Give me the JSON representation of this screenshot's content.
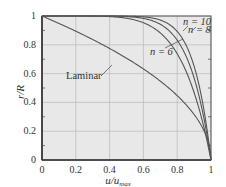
{
  "chart_data": {
    "type": "line",
    "title": "",
    "xlabel": "u/u_max",
    "ylabel": "r/R",
    "xlim": [
      0,
      1
    ],
    "ylim": [
      0,
      1
    ],
    "grid": true,
    "legend": "inline annotations",
    "xticks": [
      "0",
      "0.2",
      "0.4",
      "0.6",
      "0.8",
      "1"
    ],
    "yticks": [
      "0",
      "0.2",
      "0.4",
      "0.6",
      "0.8",
      "1"
    ],
    "series": [
      {
        "name": "Laminar",
        "formula": "r/R = sqrt(1 - u/u_max)",
        "x": [
          0,
          0.2,
          0.4,
          0.6,
          0.8,
          0.9,
          0.96,
          1.0
        ],
        "y": [
          1.0,
          0.894,
          0.775,
          0.632,
          0.447,
          0.316,
          0.2,
          0.0
        ]
      },
      {
        "name": "n = 6",
        "formula": "r/R = 1 - (u/u_max)^6",
        "x": [
          0,
          0.4,
          0.6,
          0.7,
          0.8,
          0.9,
          0.95,
          1.0
        ],
        "y": [
          1.0,
          0.996,
          0.953,
          0.882,
          0.738,
          0.469,
          0.265,
          0.0
        ]
      },
      {
        "name": "n = 8",
        "formula": "r/R = 1 - (u/u_max)^8",
        "x": [
          0,
          0.5,
          0.7,
          0.8,
          0.9,
          0.95,
          1.0
        ],
        "y": [
          1.0,
          0.996,
          0.942,
          0.832,
          0.57,
          0.337,
          0.0
        ]
      },
      {
        "name": "n = 10",
        "formula": "r/R = 1 - (u/u_max)^10",
        "x": [
          0,
          0.5,
          0.7,
          0.8,
          0.9,
          0.95,
          1.0
        ],
        "y": [
          1.0,
          0.999,
          0.972,
          0.893,
          0.651,
          0.401,
          0.0
        ]
      }
    ],
    "annotations": [
      "Laminar",
      "n = 6",
      "n = 8",
      "n = 10"
    ]
  },
  "labels": {
    "x_axis": "u/u",
    "x_axis_sub": "max",
    "y_axis": "r/R",
    "laminar": "Laminar",
    "n6": "n = 6",
    "n8": "n = 8",
    "n10": "n = 10"
  },
  "colors": {
    "plot_bg": "#e8e8e8",
    "grid": "#b8b8b8",
    "curve": "#555555",
    "axis": "#444444"
  }
}
